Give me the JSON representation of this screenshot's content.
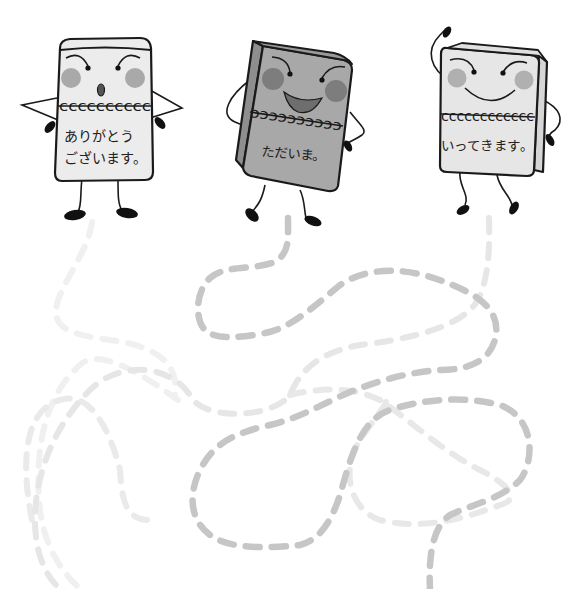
{
  "worksheet": {
    "type": "path-tracing-maze",
    "colors": {
      "outline": "#1a1a1a",
      "body_light": "#ececec",
      "body_dark": "#a8a8a8",
      "body_dark_side": "#8e8e8e",
      "cheek_light": "#a9a9a9",
      "cheek_dark": "#7d7d7d",
      "path_dark": "#c4c4c4",
      "path_mid": "#dddddd",
      "path_faint": "#efefef",
      "background": "#ffffff"
    }
  },
  "characters": [
    {
      "id": "left",
      "label_line1": "ありがとう",
      "label_line2": "ございます。",
      "expression": "surprised-open-mouth",
      "pose": "hands-on-hips"
    },
    {
      "id": "center",
      "label_line1": "ただいま。",
      "expression": "big-smile",
      "pose": "hand-on-belly"
    },
    {
      "id": "right",
      "label_line1": "いってきます。",
      "expression": "smile",
      "pose": "waving"
    }
  ],
  "paths": [
    {
      "id": "path-from-left",
      "shade": "faint"
    },
    {
      "id": "path-from-center",
      "shade": "dark"
    },
    {
      "id": "path-from-right",
      "shade": "mid"
    }
  ]
}
